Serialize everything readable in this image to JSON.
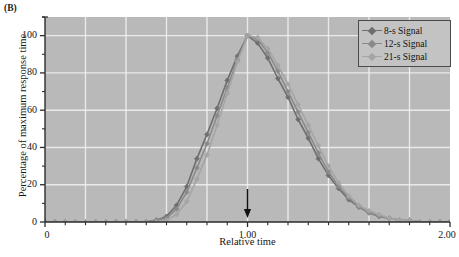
{
  "figure": {
    "panel_label": "(B)"
  },
  "chart_data": {
    "type": "line",
    "title": "",
    "xlabel": "Relative time",
    "ylabel": "Percentage of maximum response time",
    "xlim": [
      0,
      2.0
    ],
    "ylim": [
      0,
      110
    ],
    "xticks": [
      0,
      1.0,
      2.0
    ],
    "xtick_labels": [
      "0",
      "1.00",
      "2.00"
    ],
    "yticks": [
      0,
      20,
      40,
      60,
      80,
      100
    ],
    "ytick_labels": [
      "0",
      "20",
      "40",
      "60",
      "80",
      "100"
    ],
    "x_minor_tick_step": 0.1,
    "y_minor_tick_step": 10,
    "grid": true,
    "grid_color": "#f2f2f2",
    "plot_bg_color": "#b9b9b9",
    "legend_position": "top-right",
    "annotations": [
      {
        "name": "time-marker-arrow",
        "type": "arrow-down",
        "x": 1.0,
        "label": ""
      }
    ],
    "x": [
      0.0,
      0.05,
      0.1,
      0.15,
      0.2,
      0.25,
      0.3,
      0.35,
      0.4,
      0.45,
      0.5,
      0.55,
      0.6,
      0.65,
      0.7,
      0.75,
      0.8,
      0.85,
      0.9,
      0.95,
      1.0,
      1.05,
      1.1,
      1.15,
      1.2,
      1.25,
      1.3,
      1.35,
      1.4,
      1.45,
      1.5,
      1.55,
      1.6,
      1.65,
      1.7,
      1.75,
      1.8,
      1.85,
      1.9,
      1.95,
      2.0
    ],
    "series": [
      {
        "name": "8-s Signal",
        "color": "#6e6e6e",
        "marker": "diamond",
        "values": [
          0,
          0,
          0,
          0,
          0,
          0,
          0,
          0,
          0,
          0,
          0,
          1,
          3,
          9,
          19,
          34,
          47,
          61,
          76,
          89,
          100,
          96,
          88,
          77,
          67,
          55,
          45,
          34,
          25,
          18,
          12,
          8,
          5,
          3,
          2,
          1,
          1,
          0,
          0,
          0,
          0
        ]
      },
      {
        "name": "12-s Signal",
        "color": "#8a8a8a",
        "marker": "diamond",
        "values": [
          0,
          0,
          0,
          0,
          0,
          0,
          0,
          0,
          0,
          0,
          0,
          1,
          2,
          7,
          16,
          29,
          42,
          57,
          72,
          87,
          100,
          98,
          91,
          81,
          70,
          59,
          48,
          37,
          27,
          19,
          13,
          8,
          5,
          3,
          2,
          1,
          1,
          0,
          0,
          0,
          0
        ]
      },
      {
        "name": "21-s Signal",
        "color": "#a5a5a5",
        "marker": "diamond",
        "values": [
          0,
          0,
          0,
          0,
          0,
          0,
          0,
          0,
          0,
          0,
          0,
          0,
          1,
          4,
          11,
          23,
          36,
          52,
          69,
          86,
          100,
          99,
          93,
          84,
          74,
          63,
          52,
          41,
          30,
          21,
          14,
          9,
          6,
          4,
          2,
          1,
          1,
          0,
          0,
          0,
          0
        ]
      }
    ]
  }
}
